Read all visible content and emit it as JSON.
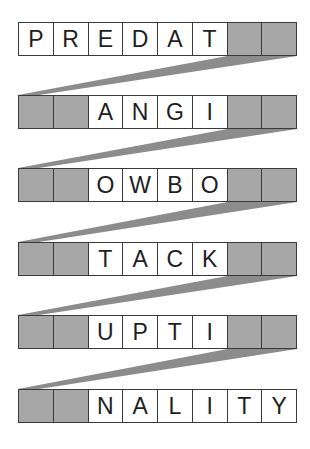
{
  "puzzle": {
    "type": "word-chain",
    "columns": 8,
    "colors": {
      "blank_cell": "#a7a7a7",
      "letter_cell": "#ffffff",
      "border": "#3a3a3a",
      "connector": "#8c8c8c"
    },
    "rows": [
      {
        "top": 22,
        "cells": [
          "P",
          "R",
          "E",
          "D",
          "A",
          "T",
          "",
          ""
        ]
      },
      {
        "top": 95,
        "cells": [
          "",
          "",
          "A",
          "N",
          "G",
          "I",
          "",
          ""
        ]
      },
      {
        "top": 168,
        "cells": [
          "",
          "",
          "O",
          "W",
          "B",
          "O",
          "",
          ""
        ]
      },
      {
        "top": 242,
        "cells": [
          "",
          "",
          "T",
          "A",
          "C",
          "K",
          "",
          ""
        ]
      },
      {
        "top": 315,
        "cells": [
          "",
          "",
          "U",
          "P",
          "T",
          "I",
          "",
          ""
        ]
      },
      {
        "top": 389,
        "cells": [
          "",
          "",
          "N",
          "A",
          "L",
          "I",
          "T",
          "Y"
        ]
      }
    ]
  }
}
